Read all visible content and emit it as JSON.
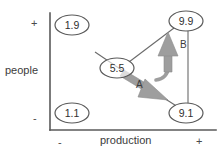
{
  "diagram": {
    "axes": {
      "y": {
        "label": "people",
        "positive_tick": "+",
        "negative_tick": "-"
      },
      "x": {
        "label": "production",
        "positive_tick": "+",
        "negative_tick": "-"
      },
      "color": "#4a4a4a"
    },
    "nodes": [
      {
        "id": "node-1-9",
        "label": "1.9",
        "cx": 72,
        "cy": 25,
        "rx": 17,
        "ry": 10
      },
      {
        "id": "node-9-9",
        "label": "9.9",
        "cx": 186,
        "cy": 21,
        "rx": 17,
        "ry": 10
      },
      {
        "id": "node-5-5",
        "label": "5.5",
        "cx": 117,
        "cy": 68,
        "rx": 17,
        "ry": 10
      },
      {
        "id": "node-1-1",
        "label": "1.1",
        "cx": 72,
        "cy": 113,
        "rx": 17,
        "ry": 10
      },
      {
        "id": "node-9-1",
        "label": "9.1",
        "cx": 186,
        "cy": 113,
        "rx": 17,
        "ry": 10
      }
    ],
    "connectors": [
      {
        "id": "edge-5-5-to-9-9",
        "from": "5.5",
        "to": "9.9"
      },
      {
        "id": "edge-5-5-to-9-1",
        "from": "5.5",
        "to": "9.1"
      },
      {
        "id": "edge-9-9-to-9-1",
        "from": "9.9",
        "to": "9.1"
      },
      {
        "id": "edge-tail-into-5-5",
        "from": "",
        "to": "5.5"
      }
    ],
    "arrows": [
      {
        "id": "arrow-a",
        "label": "A",
        "direction": "down-right",
        "from": "5.5",
        "to": "9.1",
        "color": "#9a9a9a"
      },
      {
        "id": "arrow-b",
        "label": "B",
        "direction": "up",
        "from": "9.1",
        "to": "9.9",
        "color": "#9a9a9a"
      }
    ],
    "colors": {
      "stroke": "#555555",
      "arrow_fill": "#9e9e9e",
      "text": "#333333",
      "background": "#ffffff"
    }
  }
}
